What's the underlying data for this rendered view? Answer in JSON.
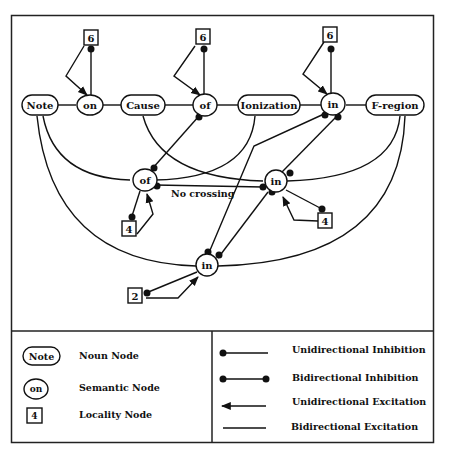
{
  "figure": {
    "noun_nodes": [
      {
        "id": "note",
        "label": "Note"
      },
      {
        "id": "cause",
        "label": "Cause"
      },
      {
        "id": "ionization",
        "label": "Ionization"
      },
      {
        "id": "fregion",
        "label": "F-region"
      }
    ],
    "semantic_nodes": [
      {
        "id": "on",
        "label": "on"
      },
      {
        "id": "of_top",
        "label": "of"
      },
      {
        "id": "in_top",
        "label": "in"
      },
      {
        "id": "of_mid",
        "label": "of"
      },
      {
        "id": "in_mid",
        "label": "in"
      },
      {
        "id": "in_low",
        "label": "in"
      }
    ],
    "locality_nodes": [
      {
        "id": "loc_on",
        "label": "6"
      },
      {
        "id": "loc_of_top",
        "label": "6"
      },
      {
        "id": "loc_in_top",
        "label": "6"
      },
      {
        "id": "loc_of_mid",
        "label": "4"
      },
      {
        "id": "loc_in_mid",
        "label": "4"
      },
      {
        "id": "loc_in_low",
        "label": "2"
      }
    ],
    "annotation": "No crossing"
  },
  "legend": {
    "nodes": [
      {
        "symbol": "Note",
        "label": "Noun Node"
      },
      {
        "symbol": "on",
        "label": "Semantic Node"
      },
      {
        "symbol": "4",
        "label": "Locality Node"
      }
    ],
    "edges": [
      {
        "label": "Unidirectional Inhibition"
      },
      {
        "label": "Bidirectional Inhibition"
      },
      {
        "label": "Unidirectional Excitation"
      },
      {
        "label": "Bidirectional Excitation"
      }
    ]
  }
}
